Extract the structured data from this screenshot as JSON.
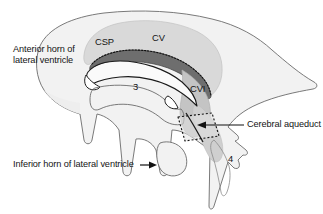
{
  "figure": {
    "type": "anatomical-diagram",
    "background_color": "#ffffff",
    "outline_color": "#6b6b6b",
    "palette": {
      "brain_fill": "#f2f2f2",
      "csp_cv_fill": "#d9d9d9",
      "corpus_callosum_fill": "#6e6e6e",
      "cvi_fill": "#c4c4c4",
      "ventricle_fill": "#fafafa",
      "aqueduct_fill": "#e2e2e2",
      "stroke_dark": "#1a1a1a",
      "text_color": "#141414"
    }
  },
  "labels": {
    "anterior_horn": "Anterior horn of\nlateral ventricle",
    "inferior_horn": "Inferior horn of lateral ventricle",
    "cerebral_aqueduct": "Cerebral aqueduct",
    "csp": "CSP",
    "cv": "CV",
    "cvi": "CVI",
    "third_ventricle": "3",
    "fourth_ventricle": "4"
  },
  "annotations": {
    "inferior_horn_arrow": "right-arrow",
    "cerebral_aqueduct_arrow": "left-arrow",
    "dashed_band": "dotted outline over corpus callosum",
    "dashed_aqueduct_box": "dotted parallelogram marking the cerebral aqueduct"
  }
}
